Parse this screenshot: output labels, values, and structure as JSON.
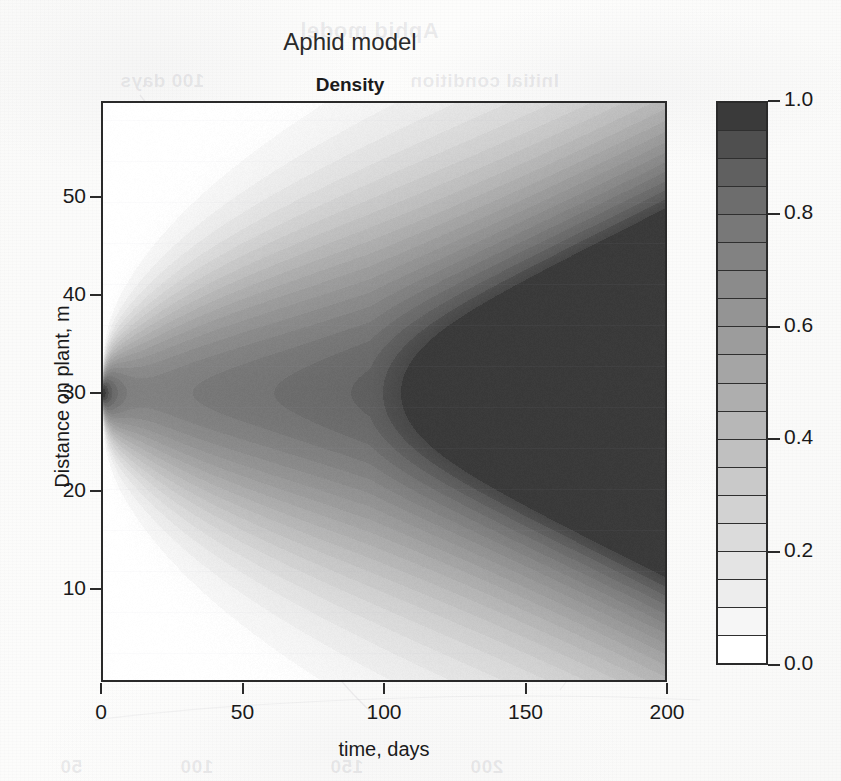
{
  "figure": {
    "title": "Aphid model",
    "subtitle": "Density"
  },
  "ghosts": [
    {
      "text": "Aphid model",
      "x": 300,
      "y": 18,
      "size": 22
    },
    {
      "text": "100 days",
      "x": 120,
      "y": 70,
      "size": 19
    },
    {
      "text": "Initial condition",
      "x": 410,
      "y": 70,
      "size": 19
    },
    {
      "text": "Mortality",
      "x": 190,
      "y": 455,
      "size": 18
    },
    {
      "text": "Mortality Verde",
      "x": 400,
      "y": 455,
      "size": 18
    },
    {
      "text": "50",
      "x": 60,
      "y": 756,
      "size": 19
    },
    {
      "text": "100",
      "x": 180,
      "y": 756,
      "size": 19
    },
    {
      "text": "150",
      "x": 330,
      "y": 756,
      "size": 19
    },
    {
      "text": "200",
      "x": 470,
      "y": 756,
      "size": 19
    }
  ],
  "chart_data": {
    "type": "heatmap",
    "title": "Aphid model",
    "subtitle": "Density",
    "xlabel": "time, days",
    "ylabel": "Distance on plant, m",
    "xlim": [
      0,
      200
    ],
    "ylim": [
      0.5,
      59.8
    ],
    "xticks": [
      0,
      50,
      100,
      150,
      200
    ],
    "yticks": [
      10,
      20,
      30,
      40,
      50
    ],
    "grid": false,
    "colorbar": {
      "label": "Density",
      "vmin": 0.0,
      "vmax": 1.0,
      "n_levels": 20,
      "ticks": [
        0.0,
        0.2,
        0.4,
        0.6,
        0.8,
        1.0
      ],
      "tick_labels": [
        "0.0",
        "0.2",
        "0.4",
        "0.6",
        "0.8",
        "1.0"
      ],
      "colormap": "grayscale-discrete",
      "orientation": "vertical",
      "position": "right",
      "band_colors": [
        "#ffffff",
        "#f6f6f6",
        "#ededed",
        "#e4e4e4",
        "#dbdbdb",
        "#d2d2d2",
        "#c9c9c9",
        "#c0c0c0",
        "#b7b7b7",
        "#aeaeae",
        "#a5a5a5",
        "#9c9c9c",
        "#949494",
        "#8b8b8b",
        "#828282",
        "#787878",
        "#6d6d6d",
        "#606060",
        "#4f4f4f",
        "#3a3a3a"
      ]
    },
    "source_point": {
      "x": 0,
      "y": 30,
      "value": 1.0
    },
    "spread_envelope": {
      "t": [
        0,
        25,
        50,
        75,
        100,
        125,
        150,
        175,
        200
      ],
      "upper_m": [
        30,
        35,
        38.5,
        41.5,
        44.5,
        47.5,
        50.5,
        53.5,
        56.5
      ],
      "lower_m": [
        30,
        25,
        21.5,
        18.5,
        15.5,
        12.5,
        9.5,
        6.5,
        3.5
      ]
    },
    "profile_peak_density": {
      "t": [
        0,
        10,
        25,
        50,
        75,
        100,
        125,
        150,
        175,
        200
      ],
      "value": [
        1.0,
        0.55,
        0.33,
        0.22,
        0.17,
        0.15,
        0.15,
        0.17,
        0.2,
        0.22
      ]
    }
  },
  "colorbar_ticks": [
    {
      "value": "1.0",
      "frac": 1.0
    },
    {
      "value": "0.8",
      "frac": 0.8
    },
    {
      "value": "0.6",
      "frac": 0.6
    },
    {
      "value": "0.4",
      "frac": 0.4
    },
    {
      "value": "0.2",
      "frac": 0.2
    },
    {
      "value": "0.0",
      "frac": 0.0
    }
  ]
}
